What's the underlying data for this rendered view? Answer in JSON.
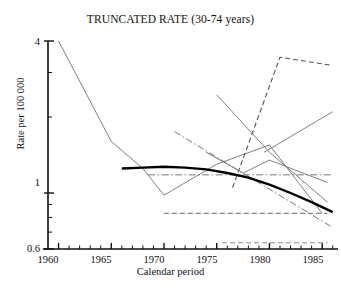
{
  "chart_data": {
    "type": "line",
    "title": "TRUNCATED RATE (30-74 years)",
    "xlabel": "Calendar period",
    "ylabel": "Rate per 100 000",
    "xlim": [
      1959,
      1986.5
    ],
    "ylim": [
      0.6,
      4.0
    ],
    "yscale": "log",
    "xscale": "linear",
    "grid": false,
    "legend": "none",
    "xticks_major": [
      1960,
      1965,
      1970,
      1975,
      1980,
      1985
    ],
    "xtick_labels": [
      "1960",
      "1965",
      "1970",
      "1975",
      "1980",
      "1985"
    ],
    "xticks_minor_step": 1,
    "yticks_labeled": [
      4,
      1,
      0.6
    ],
    "ytick_labels": [
      "4",
      "1",
      "0.6"
    ],
    "yticks_minor": [
      3,
      2,
      0.9,
      0.8,
      0.7
    ],
    "series": [
      {
        "name": "series-steep-decline",
        "style": "solid",
        "color": "#808080",
        "width": 1.0,
        "x": [
          1960,
          1965,
          1968,
          1970,
          1975,
          1980,
          1985
        ],
        "y": [
          4.0,
          1.6,
          1.25,
          0.98,
          1.3,
          1.55,
          0.83
        ]
      },
      {
        "name": "series-mid-rising",
        "style": "solid",
        "color": "#808080",
        "width": 1.0,
        "x": [
          1974,
          1977.5,
          1980,
          1985.5
        ],
        "y": [
          1.45,
          1.2,
          1.35,
          1.1
        ]
      },
      {
        "name": "series-upper-declining",
        "style": "solid",
        "color": "#808080",
        "width": 1.0,
        "x": [
          1975,
          1980,
          1985.5
        ],
        "y": [
          2.45,
          1.45,
          0.92
        ]
      },
      {
        "name": "series-lower-right-rising",
        "style": "solid",
        "color": "#808080",
        "width": 1.0,
        "x": [
          1979.5,
          1986
        ],
        "y": [
          1.45,
          2.1
        ]
      },
      {
        "name": "series-dashed-rising",
        "style": "dashed",
        "color": "#555555",
        "width": 1.1,
        "x": [
          1976.5,
          1981,
          1986
        ],
        "y": [
          1.05,
          3.45,
          3.2
        ]
      },
      {
        "name": "series-dashdot-descending",
        "style": "dashdot",
        "color": "#777777",
        "width": 1.0,
        "x": [
          1971,
          1986
        ],
        "y": [
          1.75,
          0.73
        ]
      },
      {
        "name": "series-dashdot-horizontal",
        "style": "dashdot",
        "color": "#777777",
        "width": 1.0,
        "x": [
          1968.5,
          1986
        ],
        "y": [
          1.18,
          1.18
        ]
      },
      {
        "name": "series-dashed-flat-upper",
        "style": "dashed",
        "color": "#8a8a8a",
        "width": 1.1,
        "x": [
          1970,
          1985.5
        ],
        "y": [
          0.83,
          0.83
        ]
      },
      {
        "name": "series-dashed-flat-lower",
        "style": "dashed",
        "color": "#8a8a8a",
        "width": 1.1,
        "x": [
          1975.5,
          1985.5
        ],
        "y": [
          0.635,
          0.635
        ]
      },
      {
        "name": "series-fitted-curve",
        "style": "solid",
        "color": "#000000",
        "width": 2.4,
        "x": [
          1966,
          1968,
          1970,
          1972,
          1974,
          1976,
          1978,
          1980,
          1982,
          1984,
          1986
        ],
        "y": [
          1.25,
          1.26,
          1.27,
          1.26,
          1.24,
          1.2,
          1.15,
          1.08,
          1.0,
          0.92,
          0.84
        ]
      }
    ]
  }
}
